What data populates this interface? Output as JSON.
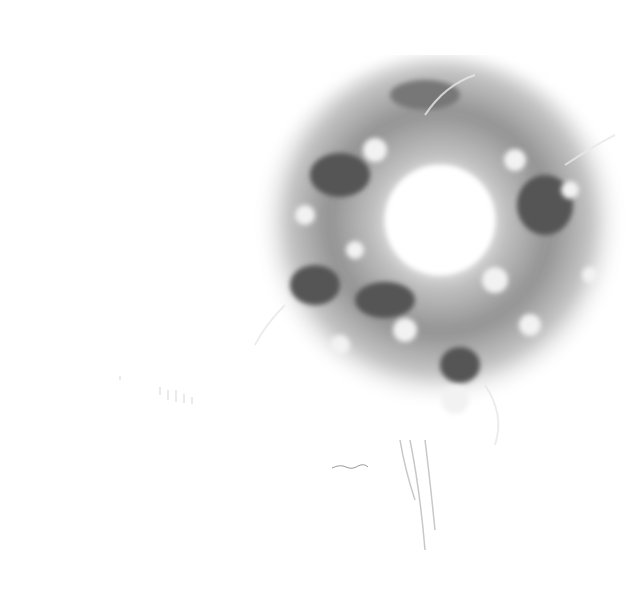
{
  "image": {
    "description": "Grayscale watercolor illustration of a floral wreath on a white background",
    "palette": {
      "background": "#ffffff",
      "dark": "#4a4a4a",
      "mid": "#8a8a8a",
      "light": "#c4c4c4",
      "pale": "#e6e6e6"
    }
  }
}
